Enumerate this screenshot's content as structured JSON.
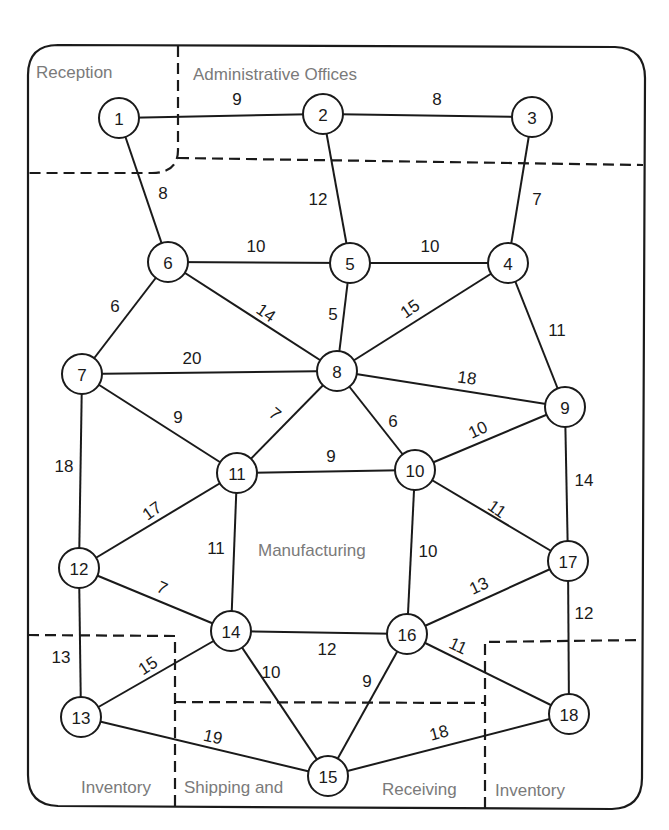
{
  "diagram": {
    "regions": [
      {
        "id": "reception",
        "label": "Reception",
        "x": 36,
        "y": 78
      },
      {
        "id": "admin",
        "label": "Administrative Offices",
        "x": 193,
        "y": 80
      },
      {
        "id": "manufacturing",
        "label": "Manufacturing",
        "x": 258,
        "y": 556
      },
      {
        "id": "inventory-left",
        "label": "Inventory",
        "x": 81,
        "y": 793
      },
      {
        "id": "shipping",
        "label": "Shipping and",
        "x": 184,
        "y": 793
      },
      {
        "id": "receiving",
        "label": "Receiving",
        "x": 382,
        "y": 795
      },
      {
        "id": "inventory-right",
        "label": "Inventory",
        "x": 495,
        "y": 796
      }
    ],
    "nodes": [
      {
        "id": "1",
        "label": "1",
        "x": 119,
        "y": 118
      },
      {
        "id": "2",
        "label": "2",
        "x": 323,
        "y": 114
      },
      {
        "id": "3",
        "label": "3",
        "x": 532,
        "y": 117
      },
      {
        "id": "4",
        "label": "4",
        "x": 508,
        "y": 263
      },
      {
        "id": "5",
        "label": "5",
        "x": 350,
        "y": 263
      },
      {
        "id": "6",
        "label": "6",
        "x": 168,
        "y": 262
      },
      {
        "id": "7",
        "label": "7",
        "x": 82,
        "y": 374
      },
      {
        "id": "8",
        "label": "8",
        "x": 337,
        "y": 371
      },
      {
        "id": "9",
        "label": "9",
        "x": 565,
        "y": 407
      },
      {
        "id": "10",
        "label": "10",
        "x": 415,
        "y": 470
      },
      {
        "id": "11",
        "label": "11",
        "x": 237,
        "y": 473
      },
      {
        "id": "12",
        "label": "12",
        "x": 79,
        "y": 568
      },
      {
        "id": "13",
        "label": "13",
        "x": 81,
        "y": 717
      },
      {
        "id": "14",
        "label": "14",
        "x": 231,
        "y": 631
      },
      {
        "id": "15",
        "label": "15",
        "x": 328,
        "y": 776
      },
      {
        "id": "16",
        "label": "16",
        "x": 407,
        "y": 634
      },
      {
        "id": "17",
        "label": "17",
        "x": 568,
        "y": 561
      },
      {
        "id": "18",
        "label": "18",
        "x": 569,
        "y": 714
      }
    ],
    "edges": [
      {
        "from": "1",
        "to": "2",
        "weight": "9",
        "lx": 237,
        "ly": 99,
        "rot": 0
      },
      {
        "from": "2",
        "to": "3",
        "weight": "8",
        "lx": 437,
        "ly": 99,
        "rot": 0
      },
      {
        "from": "1",
        "to": "6",
        "weight": "8",
        "lx": 163,
        "ly": 193,
        "rot": 0
      },
      {
        "from": "2",
        "to": "5",
        "weight": "12",
        "lx": 318,
        "ly": 199,
        "rot": 0
      },
      {
        "from": "3",
        "to": "4",
        "weight": "7",
        "lx": 537,
        "ly": 199,
        "rot": 0
      },
      {
        "from": "6",
        "to": "5",
        "weight": "10",
        "lx": 256,
        "ly": 246,
        "rot": 0
      },
      {
        "from": "5",
        "to": "4",
        "weight": "10",
        "lx": 430,
        "ly": 246,
        "rot": 0
      },
      {
        "from": "6",
        "to": "7",
        "weight": "6",
        "lx": 115,
        "ly": 306,
        "rot": 0
      },
      {
        "from": "6",
        "to": "8",
        "weight": "14",
        "lx": 266,
        "ly": 313,
        "rot": 35
      },
      {
        "from": "5",
        "to": "8",
        "weight": "5",
        "lx": 333,
        "ly": 314,
        "rot": 0
      },
      {
        "from": "4",
        "to": "8",
        "weight": "15",
        "lx": 410,
        "ly": 309,
        "rot": -35
      },
      {
        "from": "4",
        "to": "9",
        "weight": "11",
        "lx": 557,
        "ly": 330,
        "rot": 0
      },
      {
        "from": "7",
        "to": "8",
        "weight": "20",
        "lx": 192,
        "ly": 358,
        "rot": 0
      },
      {
        "from": "8",
        "to": "9",
        "weight": "18",
        "lx": 467,
        "ly": 378,
        "rot": 8
      },
      {
        "from": "7",
        "to": "11",
        "weight": "9",
        "lx": 178,
        "ly": 417,
        "rot": 0
      },
      {
        "from": "8",
        "to": "11",
        "weight": "7",
        "lx": 275,
        "ly": 414,
        "rot": 40
      },
      {
        "from": "8",
        "to": "10",
        "weight": "6",
        "lx": 393,
        "ly": 421,
        "rot": 0
      },
      {
        "from": "10",
        "to": "9",
        "weight": "10",
        "lx": 478,
        "ly": 430,
        "rot": -25
      },
      {
        "from": "11",
        "to": "10",
        "weight": "9",
        "lx": 331,
        "ly": 456,
        "rot": 0
      },
      {
        "from": "7",
        "to": "12",
        "weight": "18",
        "lx": 64,
        "ly": 466,
        "rot": 0
      },
      {
        "from": "9",
        "to": "17",
        "weight": "14",
        "lx": 584,
        "ly": 480,
        "rot": 0
      },
      {
        "from": "10",
        "to": "17",
        "weight": "11",
        "lx": 497,
        "ly": 509,
        "rot": 35
      },
      {
        "from": "11",
        "to": "12",
        "weight": "17",
        "lx": 152,
        "ly": 511,
        "rot": -35
      },
      {
        "from": "11",
        "to": "14",
        "weight": "11",
        "lx": 216,
        "ly": 548,
        "rot": 0
      },
      {
        "from": "10",
        "to": "16",
        "weight": "10",
        "lx": 428,
        "ly": 551,
        "rot": 0
      },
      {
        "from": "12",
        "to": "14",
        "weight": "7",
        "lx": 162,
        "ly": 588,
        "rot": 25
      },
      {
        "from": "16",
        "to": "17",
        "weight": "13",
        "lx": 479,
        "ly": 586,
        "rot": -25
      },
      {
        "from": "17",
        "to": "18",
        "weight": "12",
        "lx": 584,
        "ly": 613,
        "rot": 0
      },
      {
        "from": "14",
        "to": "16",
        "weight": "12",
        "lx": 327,
        "ly": 649,
        "rot": 0
      },
      {
        "from": "16",
        "to": "18",
        "weight": "11",
        "lx": 458,
        "ly": 646,
        "rot": 25
      },
      {
        "from": "12",
        "to": "13",
        "weight": "13",
        "lx": 61,
        "ly": 657,
        "rot": 0
      },
      {
        "from": "13",
        "to": "14",
        "weight": "15",
        "lx": 148,
        "ly": 666,
        "rot": -33
      },
      {
        "from": "14",
        "to": "15",
        "weight": "10",
        "lx": 271,
        "ly": 672,
        "rot": 0
      },
      {
        "from": "16",
        "to": "15",
        "weight": "9",
        "lx": 367,
        "ly": 681,
        "rot": 0
      },
      {
        "from": "13",
        "to": "15",
        "weight": "19",
        "lx": 213,
        "ly": 737,
        "rot": 12
      },
      {
        "from": "15",
        "to": "18",
        "weight": "18",
        "lx": 439,
        "ly": 733,
        "rot": -15
      }
    ]
  }
}
